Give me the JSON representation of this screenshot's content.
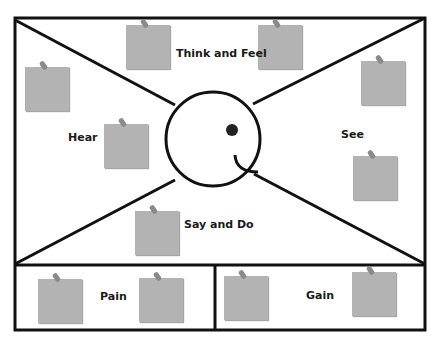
{
  "diagram": {
    "type": "empathy-map",
    "colors": {
      "line": "#111111",
      "note": "#b3b3b3",
      "pin": "#8a8a8a",
      "background": "#ffffff"
    },
    "quadrants": {
      "top": {
        "label": "Think and Feel"
      },
      "left": {
        "label": "Hear"
      },
      "right": {
        "label": "See"
      },
      "bottom": {
        "label": "Say and Do"
      }
    },
    "bottom_panels": {
      "left": {
        "label": "Pain"
      },
      "right": {
        "label": "Gain"
      }
    },
    "center": {
      "icon": "smiley-face-icon"
    },
    "sticky_notes_count": 12
  }
}
